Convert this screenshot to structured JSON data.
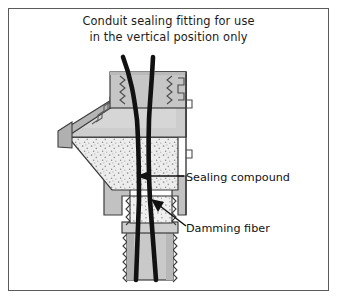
{
  "figure": {
    "title_line1": "Conduit sealing fitting for use",
    "title_line2": "in the vertical position only",
    "type": "cross-section-diagram",
    "subject": "conduit sealing fitting",
    "orientation": "vertical position only"
  },
  "labels": {
    "sealing_compound": "Sealing compound",
    "damming_fiber": "Damming fiber"
  },
  "callouts": [
    {
      "name": "sealing-compound-callout",
      "text": "Sealing compound",
      "arrow": "horizontal-left",
      "points_to": "stippled compound chamber"
    },
    {
      "name": "damming-fiber-callout",
      "text": "Damming fiber",
      "arrow": "diagonal-up-left",
      "points_to": "fiber plug in lower neck"
    }
  ],
  "colors": {
    "border": "#5a5a5a",
    "body_light": "#d3d3d3",
    "body_mid": "#bdbdbd",
    "body_dark": "#9a9a9a",
    "compound_fill": "#ebebeb",
    "stipple": "#8c8c8c",
    "wire": "#111111",
    "outline": "#3c3c3c",
    "text": "#1b1b1b",
    "background": "#ffffff"
  },
  "parts": [
    {
      "name": "upper-threaded-hub",
      "fill": "#c6c6c6"
    },
    {
      "name": "angled-body",
      "fill": "#cccccc"
    },
    {
      "name": "sealing-compound-chamber",
      "fill": "#ebebeb"
    },
    {
      "name": "damming-fiber-plug",
      "fill": "#ededed"
    },
    {
      "name": "lower-threaded-conduit",
      "fill": "#c9c9c9"
    },
    {
      "name": "conductor-wire-left",
      "fill": "#111111"
    },
    {
      "name": "conductor-wire-right",
      "fill": "#111111"
    }
  ]
}
